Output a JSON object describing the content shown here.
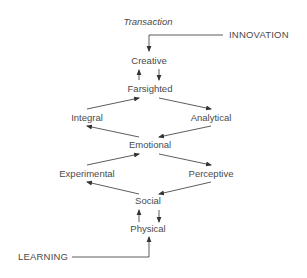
{
  "diagram": {
    "title": "Transaction",
    "inputs": {
      "top": "INNOVATION",
      "bottom": "LEARNING"
    },
    "nodes": {
      "creative": "Creative",
      "farsighted": "Farsighted",
      "integral": "Integral",
      "analytical": "Analytical",
      "emotional": "Emotional",
      "experimental": "Experimental",
      "perceptive": "Perceptive",
      "social": "Social",
      "physical": "Physical"
    },
    "edges": [
      {
        "from": "INNOVATION",
        "to": "Creative"
      },
      {
        "from": "Creative",
        "to": "Farsighted"
      },
      {
        "from": "Farsighted",
        "to": "Creative"
      },
      {
        "from": "Farsighted",
        "to": "Analytical"
      },
      {
        "from": "Analytical",
        "to": "Emotional"
      },
      {
        "from": "Emotional",
        "to": "Integral"
      },
      {
        "from": "Integral",
        "to": "Farsighted"
      },
      {
        "from": "Emotional",
        "to": "Perceptive"
      },
      {
        "from": "Perceptive",
        "to": "Social"
      },
      {
        "from": "Social",
        "to": "Experimental"
      },
      {
        "from": "Experimental",
        "to": "Emotional"
      },
      {
        "from": "Social",
        "to": "Physical"
      },
      {
        "from": "Physical",
        "to": "Social"
      },
      {
        "from": "LEARNING",
        "to": "Physical"
      }
    ],
    "colors": {
      "text": "#4a4a4a",
      "line": "#333333",
      "background": "#ffffff"
    }
  }
}
